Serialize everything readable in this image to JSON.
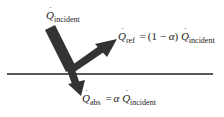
{
  "diagram": {
    "symbol": "Q",
    "labels": {
      "incident": {
        "symbol": "Q",
        "subscript": "incident"
      },
      "reflected": {
        "symbol": "Q",
        "subscript": "ref",
        "equals": "=",
        "factor_open": "(1",
        "minus": "−",
        "alpha": "α",
        "factor_close": ")",
        "rhs_symbol": "Q",
        "rhs_subscript": "incident"
      },
      "absorbed": {
        "symbol": "Q",
        "subscript": "abs",
        "equals": "=",
        "alpha": "α",
        "rhs_symbol": "Q",
        "rhs_subscript": "incident"
      }
    },
    "arrows": [
      {
        "name": "incident",
        "from": [
          52,
          28
        ],
        "to": [
          72,
          70
        ]
      },
      {
        "name": "reflected",
        "from": [
          72,
          70
        ],
        "to": [
          116,
          40
        ]
      },
      {
        "name": "absorbed",
        "from": [
          72,
          70
        ],
        "to": [
          81,
          95
        ]
      }
    ],
    "surface_line": {
      "x1": 7,
      "x2": 213,
      "y": 74
    },
    "colors": {
      "arrow": "#333333",
      "line": "#222222",
      "text": "#222222"
    }
  }
}
